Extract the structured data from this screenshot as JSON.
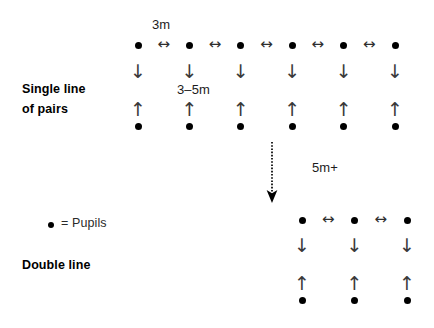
{
  "diagram": {
    "background_color": "#ffffff",
    "ink_color": "#000000",
    "arrow_color": "#3a3a3a"
  },
  "labels": {
    "single_line_line1": "Single line",
    "single_line_line2": "of pairs",
    "double_line": "Double line",
    "spacing_horizontal": "3m",
    "spacing_vertical": "3–5m",
    "spacing_between_groups": "5m+",
    "legend_equals_pupils": "= Pupils"
  },
  "icons": {
    "pupil_dot": "pupil-dot",
    "down_arrow": "↓",
    "up_arrow": "↑",
    "left_right_arrow": "↔",
    "dashed_down_arrow": "dashed-down-arrow"
  },
  "single_line_group": {
    "name": "Single line of pairs",
    "columns": 6,
    "column_x": [
      138,
      189.4,
      240.8,
      292.2,
      343.6,
      395
    ],
    "top_dot_y": 45,
    "bottom_dot_y": 126,
    "down_arrow_y": 62,
    "up_arrow_y": 100,
    "horizontal_arrow_y": 45,
    "horizontal_arrow_count": 5,
    "horizontal_arrow_x": [
      163.7,
      215.1,
      266.5,
      317.9,
      369.3
    ]
  },
  "double_line_group": {
    "name": "Double line",
    "columns": 3,
    "column_x": [
      302,
      354.5,
      407
    ],
    "top_dot_y": 220,
    "bottom_dot_y": 300,
    "down_arrow_y": 236,
    "up_arrow_y": 274,
    "horizontal_arrow_y": 220,
    "horizontal_arrow_count": 2,
    "horizontal_arrow_x": [
      328.2,
      380.7
    ]
  },
  "transition": {
    "arrow_x": 272,
    "arrow_top_y": 143,
    "arrow_bottom_y": 203,
    "label": "5m+",
    "label_x": 312,
    "label_y": 161
  },
  "legend": {
    "dot_x": 48,
    "dot_y": 222,
    "text_x": 60,
    "text_y": 217
  }
}
